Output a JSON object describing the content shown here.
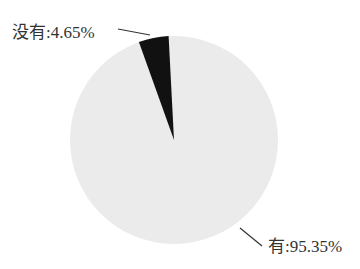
{
  "chart_data": {
    "type": "pie",
    "title": "",
    "categories": [
      "没有",
      "有"
    ],
    "values": [
      4.65,
      95.35
    ],
    "labels": [
      "没有:4.65%",
      "有:95.35%"
    ],
    "colors": [
      "#111111",
      "#ebebeb"
    ],
    "legend": "none"
  },
  "labels": {
    "no": "没有:4.65%",
    "yes": "有:95.35%"
  }
}
